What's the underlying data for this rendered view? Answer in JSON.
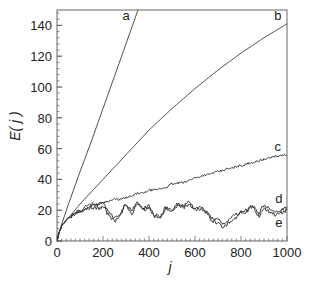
{
  "chart_data": {
    "type": "line",
    "title": "",
    "xlabel": "j",
    "ylabel": "E( j )",
    "xlim": [
      0,
      1000
    ],
    "ylim": [
      0,
      150
    ],
    "xticks": [
      0,
      200,
      400,
      600,
      800,
      1000
    ],
    "yticks": [
      0,
      20,
      40,
      60,
      80,
      100,
      120,
      140
    ],
    "grid": false,
    "legend": "inline curve labels",
    "series": [
      {
        "name": "a",
        "x": [
          0,
          10,
          25,
          50,
          100,
          150,
          200,
          250,
          300,
          352
        ],
        "values": [
          0,
          6,
          13,
          24,
          45,
          65,
          86,
          107,
          128,
          150
        ]
      },
      {
        "name": "b",
        "x": [
          0,
          10,
          25,
          50,
          100,
          150,
          200,
          300,
          400,
          500,
          600,
          700,
          800,
          900,
          1000
        ],
        "values": [
          0,
          6,
          11,
          15,
          24,
          32,
          40,
          56,
          72,
          86,
          99,
          111,
          122,
          132,
          141
        ]
      },
      {
        "name": "c",
        "x": [
          0,
          10,
          25,
          50,
          75,
          100,
          125,
          150,
          175,
          200,
          225,
          250,
          275,
          300,
          325,
          350,
          375,
          400,
          425,
          450,
          475,
          500,
          550,
          600,
          650,
          700,
          750,
          800,
          850,
          900,
          950,
          1000
        ],
        "values": [
          0,
          6,
          11,
          15,
          17,
          19,
          21,
          23,
          24,
          25,
          26,
          27,
          27,
          28,
          29,
          31,
          31,
          33,
          33,
          34,
          35,
          37,
          38,
          41,
          43,
          45,
          47,
          49,
          51,
          53,
          55,
          56
        ]
      },
      {
        "name": "d",
        "x": [
          0,
          10,
          25,
          50,
          75,
          100,
          125,
          150,
          175,
          200,
          225,
          250,
          275,
          300,
          325,
          350,
          375,
          400,
          425,
          450,
          475,
          500,
          525,
          550,
          575,
          600,
          625,
          650,
          675,
          700,
          725,
          750,
          775,
          800,
          825,
          850,
          875,
          900,
          925,
          950,
          975,
          1000
        ],
        "values": [
          0,
          6,
          11,
          15,
          18,
          20,
          22,
          24,
          23,
          25,
          19,
          15,
          18,
          24,
          20,
          25,
          21,
          23,
          17,
          16,
          22,
          20,
          24,
          23,
          25,
          21,
          22,
          19,
          15,
          14,
          11,
          14,
          17,
          19,
          20,
          23,
          18,
          23,
          21,
          19,
          20,
          22
        ]
      },
      {
        "name": "e",
        "x": [
          0,
          10,
          25,
          50,
          75,
          100,
          125,
          150,
          175,
          200,
          225,
          250,
          275,
          300,
          325,
          350,
          375,
          400,
          425,
          450,
          475,
          500,
          525,
          550,
          575,
          600,
          625,
          650,
          675,
          700,
          725,
          750,
          775,
          800,
          825,
          850,
          875,
          900,
          925,
          950,
          975,
          1000
        ],
        "values": [
          0,
          6,
          11,
          15,
          17,
          19,
          21,
          22,
          21,
          22,
          17,
          13,
          17,
          23,
          18,
          24,
          20,
          22,
          16,
          15,
          21,
          19,
          23,
          22,
          24,
          20,
          21,
          18,
          13,
          12,
          9,
          12,
          15,
          18,
          19,
          22,
          16,
          21,
          19,
          17,
          18,
          20
        ]
      }
    ],
    "labels": [
      {
        "text": "a",
        "x": 300,
        "y": 146
      },
      {
        "text": "b",
        "x": 960,
        "y": 146
      },
      {
        "text": "c",
        "x": 960,
        "y": 61
      },
      {
        "text": "d",
        "x": 965,
        "y": 27
      },
      {
        "text": "e",
        "x": 965,
        "y": 12
      }
    ]
  },
  "axes": {
    "x_title": "j",
    "y_title": "E( j )",
    "x_tick_labels": [
      "0",
      "200",
      "400",
      "600",
      "800",
      "1000"
    ],
    "y_tick_labels": [
      "0",
      "20",
      "40",
      "60",
      "80",
      "100",
      "120",
      "140"
    ]
  }
}
